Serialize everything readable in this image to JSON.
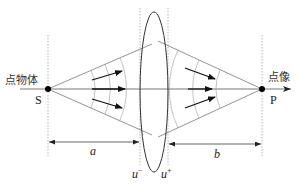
{
  "diagram": {
    "type": "optics-lens-imaging",
    "labels": {
      "object_point": "点物体",
      "object_symbol": "S",
      "image_point": "点像",
      "image_symbol": "P",
      "object_distance": "a",
      "image_distance": "b",
      "lens_left_plane": "u",
      "lens_left_sup": "−",
      "lens_right_plane": "u",
      "lens_right_sup": "+"
    },
    "colors": {
      "line": "#555555",
      "thin_line": "#888888",
      "dashed": "#9a9a9a",
      "arrow": "#111111",
      "point": "#000000"
    },
    "wavefront_arrows_left": 3,
    "wavefront_arrows_right": 3,
    "wavefront_arcs_left": 3,
    "wavefront_arcs_right": 3
  }
}
